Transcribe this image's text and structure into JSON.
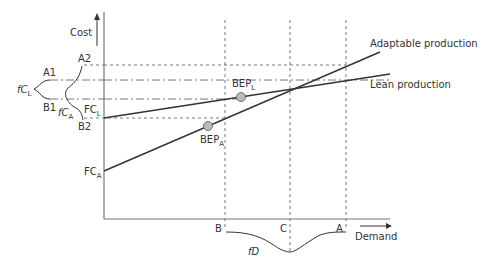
{
  "axes": {
    "y_label": "Cost",
    "x_label": "Demand"
  },
  "lines": {
    "adaptable": {
      "label": "Adaptable production"
    },
    "lean": {
      "label": "Lean production"
    }
  },
  "points": {
    "bep_lean": {
      "main": "BEP",
      "sub": "L"
    },
    "bep_adaptable": {
      "main": "BEP",
      "sub": "A"
    }
  },
  "fixed_costs": {
    "lean": {
      "main": "FC",
      "sub": "L"
    },
    "adaptable": {
      "main": "FC",
      "sub": "A"
    }
  },
  "cost_bounds": {
    "a1": "A1",
    "a2": "A2",
    "b1": "B1",
    "b2": "B2"
  },
  "distributions": {
    "fc_lean": {
      "main": "fC",
      "sub": "L"
    },
    "fc_adaptable": {
      "main": "fC",
      "sub": "A"
    },
    "demand": "fD"
  },
  "demand_marks": {
    "b": "B",
    "c": "C",
    "a": "A"
  },
  "colors": {
    "line": "#333333",
    "axis": "#777777",
    "guide": "#555555",
    "point_fill": "#bbbbbb"
  }
}
